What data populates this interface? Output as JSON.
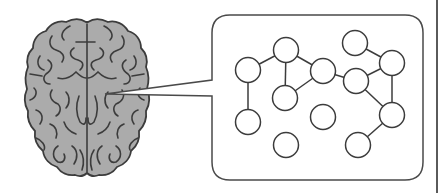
{
  "figure": {
    "description": "Brain with callout to a network graph of nodes and edges",
    "colors": {
      "background": "#ffffff",
      "brain_fill": "#ababab",
      "stroke": "#3c3c3c",
      "box_stroke": "#4a4a4a",
      "node_fill": "#ffffff",
      "rule": "#5a5a5a"
    },
    "callout_box": {
      "x": 212,
      "y": 15,
      "width": 211,
      "height": 165,
      "radius": 18
    },
    "callout_pointer": {
      "apex": [
        105,
        94
      ],
      "top": [
        212,
        80
      ],
      "bottom": [
        212,
        96
      ]
    },
    "graph": {
      "node_radius": 12.5,
      "nodes": [
        {
          "id": "A",
          "x": 248,
          "y": 70
        },
        {
          "id": "B",
          "x": 286,
          "y": 50
        },
        {
          "id": "C",
          "x": 323,
          "y": 71
        },
        {
          "id": "D",
          "x": 285,
          "y": 98
        },
        {
          "id": "E",
          "x": 248,
          "y": 122
        },
        {
          "id": "F",
          "x": 323,
          "y": 117
        },
        {
          "id": "G",
          "x": 286,
          "y": 145
        },
        {
          "id": "H",
          "x": 355,
          "y": 43
        },
        {
          "id": "I",
          "x": 356,
          "y": 81
        },
        {
          "id": "J",
          "x": 392,
          "y": 63
        },
        {
          "id": "K",
          "x": 392,
          "y": 115
        },
        {
          "id": "L",
          "x": 358,
          "y": 145
        }
      ],
      "edges": [
        [
          "A",
          "B"
        ],
        [
          "B",
          "C"
        ],
        [
          "B",
          "D"
        ],
        [
          "C",
          "D"
        ],
        [
          "A",
          "E"
        ],
        [
          "C",
          "I"
        ],
        [
          "H",
          "J"
        ],
        [
          "I",
          "J"
        ],
        [
          "J",
          "K"
        ],
        [
          "I",
          "K"
        ],
        [
          "K",
          "L"
        ]
      ]
    }
  }
}
